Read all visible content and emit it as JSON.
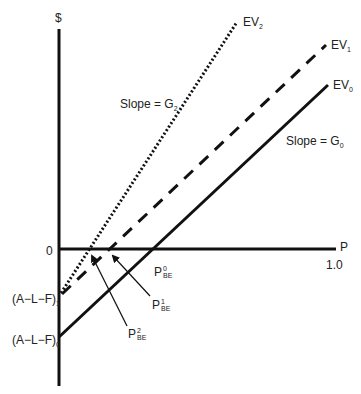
{
  "axes": {
    "y_label": "$",
    "x_label": "P",
    "origin_label": "0",
    "x_end_tick": "1.0"
  },
  "intercepts": {
    "afl1": {
      "base": "(A−L−F)",
      "sub": "1"
    },
    "afl0": {
      "base": "(A−L−F)",
      "sub": "0"
    }
  },
  "lines": {
    "ev0": {
      "base": "EV",
      "sub": "0",
      "style": "solid"
    },
    "ev1": {
      "base": "EV",
      "sub": "1",
      "style": "dashed"
    },
    "ev2": {
      "base": "EV",
      "sub": "2",
      "style": "dotted"
    }
  },
  "slopes": {
    "g2": {
      "base": "Slope = G",
      "sub": "2"
    },
    "g0": {
      "base": "Slope = G",
      "sub": "0"
    }
  },
  "breakevens": {
    "p0": {
      "base": "P",
      "sup": "0",
      "sub": "BE"
    },
    "p1": {
      "base": "P",
      "sup": "1",
      "sub": "BE"
    },
    "p2": {
      "base": "P",
      "sup": "2",
      "sub": "BE"
    }
  },
  "colors": {
    "line": "#111111",
    "text": "#222222",
    "background": "#ffffff"
  }
}
